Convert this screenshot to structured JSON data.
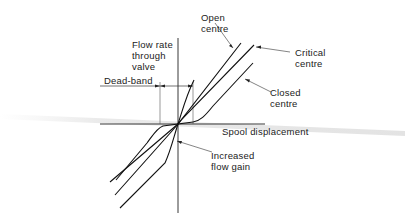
{
  "diagram": {
    "type": "valve-flow-characteristic",
    "axes": {
      "y_label": [
        "Flow  rate",
        "through",
        "valve"
      ],
      "x_label": "Spool  displacement"
    },
    "annotations": {
      "dead_band": "Dead-band",
      "open_centre": [
        "Open",
        "centre"
      ],
      "critical_centre": [
        "Critical",
        "centre"
      ],
      "closed_centre": [
        "Closed",
        "centre"
      ],
      "increased_flow_gain": [
        "Increased",
        "flow  gain"
      ]
    },
    "curves": [
      {
        "name": "Open centre",
        "shape": "straight line through origin, leftmost upper branch"
      },
      {
        "name": "Critical centre",
        "shape": "straight line through origin"
      },
      {
        "name": "Closed centre",
        "shape": "S-curve with flat dead-band near origin"
      }
    ],
    "colors": {
      "ink": "#222222",
      "background": "#ffffff"
    }
  }
}
